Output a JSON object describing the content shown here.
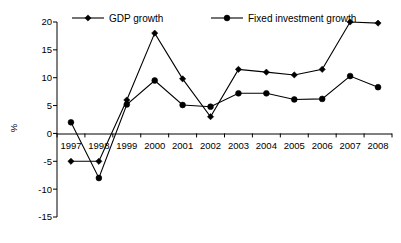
{
  "chart_data": {
    "type": "line",
    "title": "",
    "xlabel": "",
    "ylabel": "%",
    "ylim": [
      -15,
      20
    ],
    "yticks": [
      -15,
      -10,
      -5,
      0,
      5,
      10,
      15,
      20
    ],
    "ytick_labels": [
      "-15",
      "-10",
      "-5",
      "0",
      "5",
      "10",
      "15",
      "20"
    ],
    "grid": false,
    "legend_position": "top",
    "categories": [
      "1997",
      "1998",
      "1999",
      "2000",
      "2001",
      "2002",
      "2003",
      "2004",
      "2005",
      "2006",
      "2007",
      "2008"
    ],
    "series": [
      {
        "name": "GDP growth",
        "marker": "diamond",
        "color": "#000000",
        "values": [
          -5.0,
          -5.0,
          6.0,
          18.0,
          9.8,
          3.0,
          11.5,
          11.0,
          10.5,
          11.5,
          20.0,
          19.8
        ]
      },
      {
        "name": "Fixed investment growth",
        "marker": "circle",
        "color": "#000000",
        "values": [
          2.0,
          -8.0,
          5.2,
          9.5,
          5.1,
          4.8,
          7.2,
          7.2,
          6.1,
          6.2,
          10.3,
          8.3
        ]
      }
    ]
  },
  "legend": {
    "items": [
      {
        "label": "GDP growth",
        "marker": "diamond"
      },
      {
        "label": "Fixed investment growth",
        "marker": "circle"
      }
    ]
  },
  "axes": {
    "y_axis_label": "%",
    "y_tick_labels": [
      "20",
      "15",
      "10",
      "5",
      "0",
      "-5",
      "-10",
      "-15"
    ],
    "x_tick_labels": [
      "1997",
      "1998",
      "1999",
      "2000",
      "2001",
      "2002",
      "2003",
      "2004",
      "2005",
      "2006",
      "2007",
      "2008"
    ]
  }
}
